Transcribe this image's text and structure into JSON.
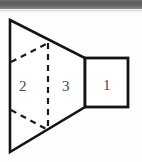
{
  "figure": {
    "width": 142,
    "height": 162,
    "background_color": "#fdfdfd",
    "stroke_color": "#141414",
    "label_color": "#4a4a4a",
    "artifact": {
      "name": "scan-artifact-bar",
      "color": "#5d5d5d",
      "height": 9
    },
    "labels": [
      {
        "id": "region-1",
        "text": "1",
        "x": 103,
        "y": 78
      },
      {
        "id": "region-2",
        "text": "2",
        "x": 19,
        "y": 79
      },
      {
        "id": "region-3",
        "text": "3",
        "x": 62,
        "y": 79
      }
    ],
    "shapes": {
      "trapezoid": {
        "name": "trapezoid-outline",
        "points": "10,20 85,58 85,107 10,152",
        "vertices": [
          {
            "x": 10,
            "y": 20
          },
          {
            "x": 85,
            "y": 58
          },
          {
            "x": 85,
            "y": 107
          },
          {
            "x": 10,
            "y": 152
          }
        ]
      },
      "square": {
        "name": "square-outline",
        "x": 85,
        "y": 58,
        "width": 43,
        "height": 49
      },
      "hidden_edges": [
        {
          "name": "dashed-vertical-fold",
          "x1": 48,
          "y1": 43,
          "x2": 48,
          "y2": 130
        },
        {
          "name": "dashed-upper-diagonal",
          "x1": 11,
          "y1": 62,
          "x2": 48,
          "y2": 43
        },
        {
          "name": "dashed-lower-diagonal",
          "x1": 11,
          "y1": 110,
          "x2": 48,
          "y2": 130
        }
      ]
    }
  }
}
